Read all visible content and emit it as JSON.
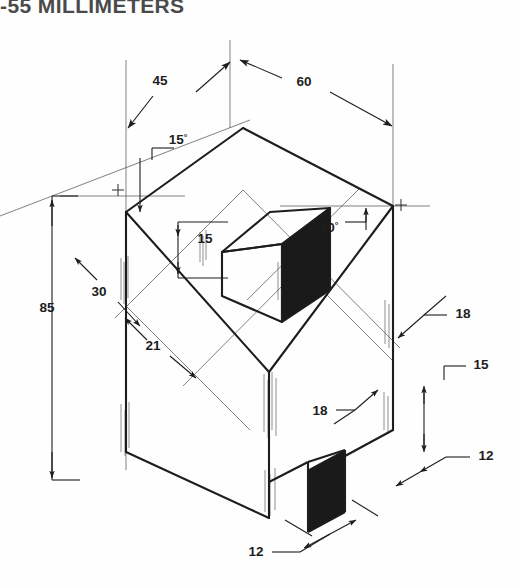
{
  "title": "-55 MILLIMETERS",
  "drawing": {
    "type": "isometric-technical-drawing",
    "units": "millimeters",
    "description": "Isometric pictorial of a pentagonal (house-shaped) prism with a raised rectangular block on the top face and a rectangular notch cut in the lower right front face",
    "colors": {
      "background": "#fefefe",
      "line": "#1d1d1d",
      "thin_line": "#3a3a3a",
      "shaded_face": "#1a1a1a",
      "title_text": "#4a4a4a"
    },
    "dimensions": [
      {
        "id": "d-45",
        "label": "45",
        "x": 160,
        "y": 85,
        "note": "top left oblique width"
      },
      {
        "id": "d-60",
        "label": "60",
        "x": 304,
        "y": 86,
        "note": "top right oblique width"
      },
      {
        "id": "a-15",
        "label": "15",
        "suffix": "°",
        "x": 178,
        "y": 144,
        "note": "left roof slope angle"
      },
      {
        "id": "a-30",
        "label": "30",
        "suffix": "°",
        "x": 329,
        "y": 232,
        "note": "right roof slope angle"
      },
      {
        "id": "d-15a",
        "label": "15",
        "x": 205,
        "y": 243,
        "note": "raised block height"
      },
      {
        "id": "d-30",
        "label": "30",
        "x": 99,
        "y": 296,
        "note": "left gable rise"
      },
      {
        "id": "d-21",
        "label": "21",
        "x": 153,
        "y": 350,
        "note": "left block offset"
      },
      {
        "id": "d-85",
        "label": "85",
        "x": 47,
        "y": 312,
        "note": "overall height"
      },
      {
        "id": "d-18a",
        "label": "18",
        "x": 455,
        "y": 313,
        "note": "upper right depth"
      },
      {
        "id": "d-15b",
        "label": "15",
        "x": 475,
        "y": 364,
        "note": "notch height"
      },
      {
        "id": "d-18b",
        "label": "18",
        "x": 320,
        "y": 409,
        "note": "front face offset"
      },
      {
        "id": "d-12a",
        "label": "12",
        "x": 478,
        "y": 455,
        "note": "notch depth right"
      },
      {
        "id": "d-12b",
        "label": "12",
        "x": 254,
        "y": 551,
        "note": "notch width bottom"
      }
    ],
    "markers": [
      {
        "id": "cross-left",
        "glyph": "+",
        "x": 118,
        "y": 190
      },
      {
        "id": "cross-right",
        "glyph": "+",
        "x": 401,
        "y": 205
      }
    ]
  }
}
